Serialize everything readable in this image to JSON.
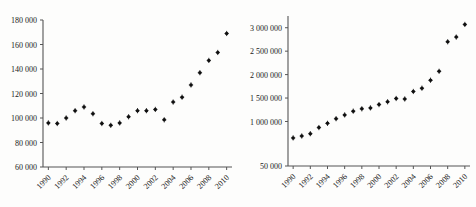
{
  "page": {
    "background_color": "#fdfdfc",
    "ink_color": "#1a1a1a",
    "axis_color": "#555555",
    "marker_color": "#111111"
  },
  "bleed_through": {
    "note": "faint reverse-side print visible through the paper",
    "color": "#b9b6b1",
    "lines": [
      "",
      "",
      "",
      "",
      "",
      "",
      ""
    ]
  },
  "chart_data": [
    {
      "id": "left-scatter",
      "type": "scatter",
      "title": "",
      "xlabel": "",
      "ylabel": "",
      "xlim": [
        1989.4,
        2010.6
      ],
      "ylim": [
        60000,
        180000
      ],
      "grid": false,
      "legend": "none",
      "xticks": [
        1990,
        1992,
        1994,
        1996,
        1998,
        2000,
        2002,
        2004,
        2006,
        2008,
        2010
      ],
      "xtick_labels": [
        "1990",
        "1992",
        "1994",
        "1996",
        "1998",
        "2000",
        "2002",
        "2004",
        "2006",
        "2008",
        "2010"
      ],
      "yticks": [
        60000,
        80000,
        100000,
        120000,
        140000,
        160000,
        180000
      ],
      "ytick_labels": [
        "60 000",
        "80 000",
        "100 000",
        "120 000",
        "140 000",
        "160 000",
        "180 000"
      ],
      "x": [
        1990,
        1991,
        1992,
        1993,
        1994,
        1995,
        1996,
        1997,
        1998,
        1999,
        2000,
        2001,
        2002,
        2003,
        2004,
        2005,
        2006,
        2007,
        2008,
        2009,
        2010
      ],
      "values": [
        96000,
        95500,
        100000,
        106000,
        109000,
        103500,
        95500,
        94000,
        96000,
        101000,
        106000,
        106000,
        107000,
        98500,
        113000,
        117000,
        127000,
        137000,
        147000,
        153500,
        169000
      ]
    },
    {
      "id": "right-scatter",
      "type": "scatter",
      "title": "",
      "xlabel": "",
      "ylabel": "",
      "xlim": [
        1989.4,
        2010.6
      ],
      "ylim": [
        50000,
        3250000
      ],
      "grid": false,
      "legend": "none",
      "xticks": [
        1990,
        1992,
        1994,
        1996,
        1998,
        2000,
        2002,
        2004,
        2006,
        2008,
        2010
      ],
      "xtick_labels": [
        "1990",
        "1992",
        "1994",
        "1996",
        "1998",
        "2000",
        "2002",
        "2004",
        "2006",
        "2008",
        "2010"
      ],
      "yticks": [
        50000,
        1000000,
        1500000,
        2000000,
        2500000,
        3000000
      ],
      "ytick_labels": [
        "50 000",
        "1 000 000",
        "1 500 000",
        "2 000 000",
        "2 500 000",
        "3 000 000"
      ],
      "x": [
        1990,
        1991,
        1992,
        1993,
        1994,
        1995,
        1996,
        1997,
        1998,
        1999,
        2000,
        2001,
        2002,
        2003,
        2004,
        2005,
        2006,
        2007,
        2008,
        2009,
        2010
      ],
      "values": [
        650000,
        690000,
        740000,
        870000,
        960000,
        1060000,
        1140000,
        1220000,
        1270000,
        1290000,
        1360000,
        1420000,
        1490000,
        1480000,
        1640000,
        1710000,
        1880000,
        2070000,
        2700000,
        2800000,
        3070000
      ]
    }
  ]
}
